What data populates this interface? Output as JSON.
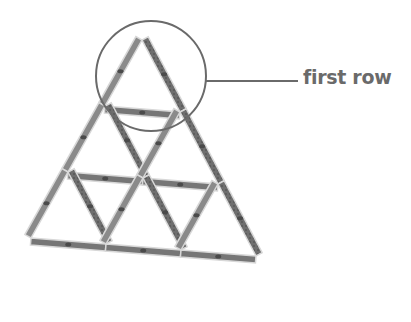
{
  "diagram": {
    "rows": 3,
    "triangles_per_row": [
      1,
      2,
      3
    ],
    "callout": {
      "label": "first row",
      "target": "top row of the pyramid",
      "shape": "circle"
    },
    "colors": {
      "card_back": "#6b6b6b",
      "card_edge": "#d8d8d8",
      "card_pattern": "#4a4a4a",
      "callout_line": "#6a6a6a",
      "label_text": "#6a6a6a",
      "background": "#ffffff"
    }
  }
}
